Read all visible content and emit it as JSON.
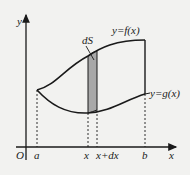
{
  "diagram": {
    "type": "area-between-curves",
    "axes": {
      "origin_label": "O",
      "x_label": "x",
      "y_label": "y"
    },
    "curves": {
      "upper": {
        "label": "y=f(x)"
      },
      "lower": {
        "label": "y=g(x)"
      }
    },
    "strip": {
      "label": "dS",
      "fill": "#a8a8a8"
    },
    "x_ticks": [
      {
        "label": "a"
      },
      {
        "label": "x"
      },
      {
        "label": "x+dx"
      },
      {
        "label": "b"
      }
    ],
    "colors": {
      "background": "#f2f2f0",
      "stroke": "#1a1a1a",
      "strip_fill": "#a8a8a8"
    }
  }
}
